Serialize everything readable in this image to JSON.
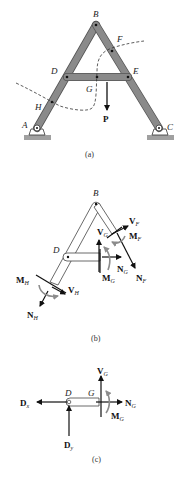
{
  "figure": {
    "panels": [
      {
        "id": "a",
        "caption": "(a)",
        "description": "A-frame with members ABC-like legs AB and BC, crossbar DE, loaded by P at G; dashed section line through F, G, H",
        "points": {
          "A": "A",
          "B": "B",
          "C": "C",
          "D": "D",
          "E": "E",
          "F": "F",
          "G": "G",
          "H": "H"
        },
        "load": {
          "label": "P"
        }
      },
      {
        "id": "b",
        "caption": "(b)",
        "description": "Free-body diagram of upper section cut at F, G, H",
        "points": {
          "B": "B",
          "D": "D"
        },
        "forces": {
          "VF": {
            "main": "V",
            "sub": "F"
          },
          "MF": {
            "main": "M",
            "sub": "F"
          },
          "NF": {
            "main": "N",
            "sub": "F"
          },
          "VG": {
            "main": "V",
            "sub": "G"
          },
          "MG": {
            "main": "M",
            "sub": "G"
          },
          "NG": {
            "main": "N",
            "sub": "G"
          },
          "MH": {
            "main": "M",
            "sub": "H"
          },
          "VH": {
            "main": "V",
            "sub": "H"
          },
          "NH": {
            "main": "N",
            "sub": "H"
          }
        }
      },
      {
        "id": "c",
        "caption": "(c)",
        "description": "Free-body diagram of segment DG",
        "points": {
          "D": "D",
          "G": "G"
        },
        "forces": {
          "Dx": {
            "main": "D",
            "sub": "x"
          },
          "Dy": {
            "main": "D",
            "sub": "y"
          },
          "VG": {
            "main": "V",
            "sub": "G"
          },
          "MG": {
            "main": "M",
            "sub": "G"
          },
          "NG": {
            "main": "N",
            "sub": "G"
          }
        }
      }
    ],
    "colors": {
      "member_fill": "#8a8a8a",
      "member_stroke": "#555555",
      "ground": "#a0a0a0",
      "moment_arrow": "#8c8c8c",
      "ink": "#111111"
    }
  }
}
